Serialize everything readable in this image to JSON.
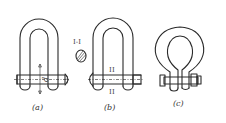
{
  "figure": {
    "panels": [
      {
        "id": "a",
        "caption": "(a)",
        "dimension_label": "d"
      },
      {
        "id": "b",
        "caption": "(b)",
        "section_marks": [
          "I",
          "I"
        ]
      },
      {
        "id": "c",
        "caption": "(c)"
      }
    ],
    "section_view": {
      "label": "I-I"
    }
  }
}
